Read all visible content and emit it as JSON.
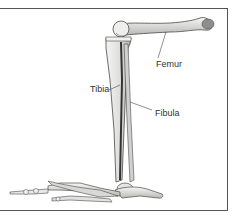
{
  "diagram": {
    "labels": {
      "femur": "Femur",
      "tibia": "Tibia",
      "fibula": "Fibula"
    },
    "colors": {
      "bone_fill": "#e8e8e6",
      "bone_shade": "#9a9a98",
      "bone_outline": "#4a4a4a",
      "frame": "#555555",
      "text": "#333333"
    }
  }
}
